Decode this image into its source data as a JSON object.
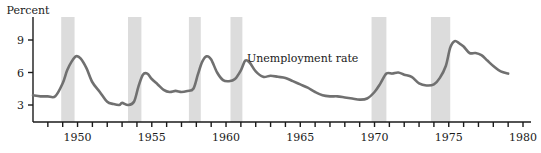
{
  "figure": {
    "background_color": "#ffffff",
    "axis_color": "#1a1a1a",
    "line_color": "#707070",
    "band_color": "#dcdcdc",
    "percent_label": "Percent",
    "annotation": "Unemployment rate"
  },
  "chart_data": {
    "type": "line",
    "title": "",
    "subtitle": "",
    "xlabel": "",
    "ylabel": "Percent",
    "xlim": [
      1947,
      1980
    ],
    "ylim": [
      2.0,
      10.2
    ],
    "grid": false,
    "legend_position": "inline-annotation",
    "annotations": [
      {
        "text": "Unemployment rate",
        "x": 1965.0,
        "y": 7.4
      }
    ],
    "y_ticks": [
      3,
      6,
      9
    ],
    "y_tick_labels": [
      "3",
      "6",
      "9"
    ],
    "x_ticks": [
      1948,
      1949,
      1950,
      1951,
      1952,
      1953,
      1954,
      1955,
      1956,
      1957,
      1958,
      1959,
      1960,
      1961,
      1962,
      1963,
      1964,
      1965,
      1966,
      1967,
      1968,
      1969,
      1970,
      1971,
      1972,
      1973,
      1974,
      1975,
      1976,
      1977,
      1978,
      1979,
      1980
    ],
    "x_tick_labels_shown": [
      "1950",
      "1955",
      "1960",
      "1965",
      "1970",
      "1975",
      "1980"
    ],
    "x_tick_label_years": [
      1950,
      1955,
      1960,
      1965,
      1970,
      1975,
      1980
    ],
    "series": [
      {
        "name": "Unemployment rate",
        "color": "#707070",
        "x": [
          1947.0,
          1947.5,
          1948.0,
          1948.5,
          1949.0,
          1949.3,
          1949.6,
          1949.9,
          1950.2,
          1950.6,
          1951.0,
          1951.5,
          1952.0,
          1952.4,
          1952.8,
          1953.0,
          1953.4,
          1953.8,
          1954.1,
          1954.4,
          1954.7,
          1955.0,
          1955.4,
          1955.8,
          1956.2,
          1956.6,
          1957.0,
          1957.4,
          1957.8,
          1958.1,
          1958.4,
          1958.7,
          1959.0,
          1959.4,
          1959.8,
          1960.2,
          1960.6,
          1961.0,
          1961.3,
          1961.6,
          1962.0,
          1962.5,
          1963.0,
          1963.5,
          1964.0,
          1964.5,
          1965.0,
          1965.5,
          1966.0,
          1966.5,
          1967.0,
          1967.5,
          1968.0,
          1968.5,
          1969.0,
          1969.5,
          1970.0,
          1970.4,
          1970.8,
          1971.2,
          1971.6,
          1972.0,
          1972.5,
          1973.0,
          1973.5,
          1974.0,
          1974.4,
          1974.8,
          1975.1,
          1975.4,
          1975.7,
          1976.0,
          1976.4,
          1976.8,
          1977.2,
          1977.6,
          1978.0,
          1978.5,
          1979.0
        ],
        "y": [
          3.9,
          3.8,
          3.8,
          3.8,
          5.0,
          6.2,
          7.0,
          7.5,
          7.3,
          6.4,
          5.1,
          4.2,
          3.3,
          3.1,
          3.0,
          3.2,
          3.0,
          3.3,
          4.7,
          5.8,
          5.9,
          5.4,
          4.9,
          4.4,
          4.2,
          4.3,
          4.2,
          4.3,
          4.5,
          5.8,
          7.0,
          7.5,
          7.2,
          6.0,
          5.3,
          5.2,
          5.4,
          6.2,
          7.1,
          6.9,
          6.1,
          5.6,
          5.7,
          5.6,
          5.5,
          5.2,
          4.9,
          4.6,
          4.2,
          3.9,
          3.8,
          3.8,
          3.7,
          3.6,
          3.5,
          3.6,
          4.2,
          5.0,
          5.9,
          5.9,
          6.0,
          5.8,
          5.6,
          5.0,
          4.8,
          4.9,
          5.5,
          6.6,
          8.3,
          8.9,
          8.7,
          8.4,
          7.8,
          7.8,
          7.6,
          7.1,
          6.6,
          6.1,
          5.9
        ]
      }
    ],
    "recession_bands": [
      {
        "start": 1948.9,
        "end": 1949.8,
        "label": "1948-49 recession"
      },
      {
        "start": 1953.4,
        "end": 1954.3,
        "label": "1953-54 recession"
      },
      {
        "start": 1957.5,
        "end": 1958.3,
        "label": "1957-58 recession"
      },
      {
        "start": 1960.3,
        "end": 1961.1,
        "label": "1960-61 recession"
      },
      {
        "start": 1969.8,
        "end": 1970.8,
        "label": "1969-70 recession"
      },
      {
        "start": 1973.8,
        "end": 1975.1,
        "label": "1973-75 recession"
      }
    ]
  }
}
